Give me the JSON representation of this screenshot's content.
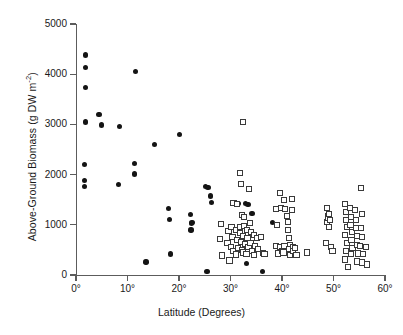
{
  "chart_data": {
    "type": "scatter",
    "title": "",
    "xlabel": "Latitude (Degrees)",
    "ylabel": "Above-Ground Biomass (g DW m",
    "ylabel_sup": "-2",
    "ylabel_tail": ")",
    "xlim": [
      0,
      60
    ],
    "ylim": [
      0,
      5000
    ],
    "grid": false,
    "legend": "none",
    "xticks": [
      0,
      10,
      20,
      30,
      40,
      50,
      60
    ],
    "xtick_labels": [
      "0°",
      "10°",
      "20°",
      "30°",
      "40°",
      "50°",
      "60°"
    ],
    "yticks": [
      0,
      1000,
      2000,
      3000,
      4000,
      5000
    ],
    "ytick_labels": [
      "0",
      "1000",
      "2000",
      "3000",
      "4000",
      "5000"
    ],
    "series": [
      {
        "name": "filled-circles",
        "marker": "circle",
        "color": "#141414",
        "points": [
          [
            1.8,
            4380
          ],
          [
            1.8,
            4130
          ],
          [
            1.8,
            3740
          ],
          [
            1.8,
            3050
          ],
          [
            1.6,
            2200
          ],
          [
            1.7,
            1880
          ],
          [
            1.7,
            1760
          ],
          [
            4.5,
            3200
          ],
          [
            4.9,
            2990
          ],
          [
            8.4,
            2960
          ],
          [
            8.3,
            1800
          ],
          [
            11.6,
            4060
          ],
          [
            11.3,
            2220
          ],
          [
            11.4,
            2010
          ],
          [
            13.6,
            260
          ],
          [
            15.2,
            2600
          ],
          [
            18.0,
            1330
          ],
          [
            18.2,
            1110
          ],
          [
            18.4,
            420
          ],
          [
            20.1,
            2800
          ],
          [
            22.2,
            1210
          ],
          [
            22.5,
            1050
          ],
          [
            22.4,
            1030
          ],
          [
            22.3,
            900
          ],
          [
            25.2,
            1760
          ],
          [
            25.6,
            1740
          ],
          [
            25.4,
            70
          ],
          [
            26.1,
            1570
          ],
          [
            26.3,
            1450
          ],
          [
            31.6,
            1430
          ],
          [
            32.9,
            1420
          ],
          [
            33.4,
            1400
          ],
          [
            34.2,
            1230
          ],
          [
            33.1,
            235
          ],
          [
            36.2,
            70
          ],
          [
            38.2,
            1050
          ]
        ]
      },
      {
        "name": "open-squares",
        "marker": "square",
        "color": "#3a3a3a",
        "points": [
          [
            32.5,
            3050
          ],
          [
            31.8,
            2030
          ],
          [
            32.1,
            1810
          ],
          [
            33.6,
            1720
          ],
          [
            30.6,
            1430
          ],
          [
            31.3,
            1420
          ],
          [
            32.2,
            1190
          ],
          [
            28.2,
            1010
          ],
          [
            28.0,
            720
          ],
          [
            28.3,
            390
          ],
          [
            29.6,
            880
          ],
          [
            29.4,
            640
          ],
          [
            29.8,
            290
          ],
          [
            30.2,
            950
          ],
          [
            30.4,
            760
          ],
          [
            30.1,
            560
          ],
          [
            30.6,
            480
          ],
          [
            31.0,
            900
          ],
          [
            31.2,
            700
          ],
          [
            31.4,
            540
          ],
          [
            31.1,
            410
          ],
          [
            31.8,
            960
          ],
          [
            31.9,
            830
          ],
          [
            32.0,
            660
          ],
          [
            32.2,
            500
          ],
          [
            32.6,
            1150
          ],
          [
            32.7,
            980
          ],
          [
            32.5,
            770
          ],
          [
            32.8,
            610
          ],
          [
            32.4,
            450
          ],
          [
            33.2,
            900
          ],
          [
            33.3,
            730
          ],
          [
            33.5,
            560
          ],
          [
            33.1,
            420
          ],
          [
            33.8,
            1030
          ],
          [
            34.0,
            860
          ],
          [
            33.9,
            640
          ],
          [
            34.1,
            470
          ],
          [
            34.6,
            790
          ],
          [
            34.8,
            570
          ],
          [
            34.5,
            400
          ],
          [
            35.2,
            730
          ],
          [
            35.4,
            520
          ],
          [
            36.0,
            760
          ],
          [
            36.3,
            440
          ],
          [
            36.6,
            420
          ],
          [
            38.8,
            1320
          ],
          [
            39.0,
            1000
          ],
          [
            38.9,
            570
          ],
          [
            39.2,
            430
          ],
          [
            39.6,
            1640
          ],
          [
            39.8,
            1330
          ],
          [
            39.7,
            560
          ],
          [
            40.0,
            470
          ],
          [
            40.4,
            1500
          ],
          [
            40.6,
            1310
          ],
          [
            40.5,
            580
          ],
          [
            40.3,
            450
          ],
          [
            41.0,
            1180
          ],
          [
            41.2,
            1060
          ],
          [
            41.1,
            900
          ],
          [
            41.3,
            740
          ],
          [
            41.5,
            600
          ],
          [
            41.4,
            520
          ],
          [
            41.6,
            400
          ],
          [
            41.9,
            1510
          ],
          [
            42.0,
            1300
          ],
          [
            42.2,
            560
          ],
          [
            42.1,
            470
          ],
          [
            42.6,
            530
          ],
          [
            42.8,
            400
          ],
          [
            44.8,
            450
          ],
          [
            48.7,
            1330
          ],
          [
            48.9,
            1180
          ],
          [
            48.8,
            1050
          ],
          [
            49.0,
            1130
          ],
          [
            49.2,
            1210
          ],
          [
            49.1,
            960
          ],
          [
            49.3,
            1090
          ],
          [
            48.5,
            640
          ],
          [
            49.5,
            560
          ],
          [
            49.8,
            470
          ],
          [
            52.3,
            1410
          ],
          [
            52.5,
            1250
          ],
          [
            52.4,
            1100
          ],
          [
            52.6,
            950
          ],
          [
            52.2,
            790
          ],
          [
            52.7,
            640
          ],
          [
            52.5,
            480
          ],
          [
            52.3,
            310
          ],
          [
            52.8,
            160
          ],
          [
            53.2,
            1330
          ],
          [
            53.4,
            1150
          ],
          [
            53.3,
            1000
          ],
          [
            53.6,
            860
          ],
          [
            53.5,
            700
          ],
          [
            53.7,
            540
          ],
          [
            53.4,
            420
          ],
          [
            54.2,
            1290
          ],
          [
            54.4,
            1100
          ],
          [
            54.3,
            930
          ],
          [
            54.6,
            780
          ],
          [
            54.5,
            600
          ],
          [
            54.8,
            430
          ],
          [
            54.6,
            270
          ],
          [
            55.3,
            1740
          ],
          [
            55.5,
            1210
          ],
          [
            55.4,
            940
          ],
          [
            55.6,
            760
          ],
          [
            55.2,
            580
          ],
          [
            55.7,
            420
          ],
          [
            55.5,
            250
          ],
          [
            56.3,
            560
          ],
          [
            56.5,
            210
          ]
        ]
      }
    ]
  }
}
